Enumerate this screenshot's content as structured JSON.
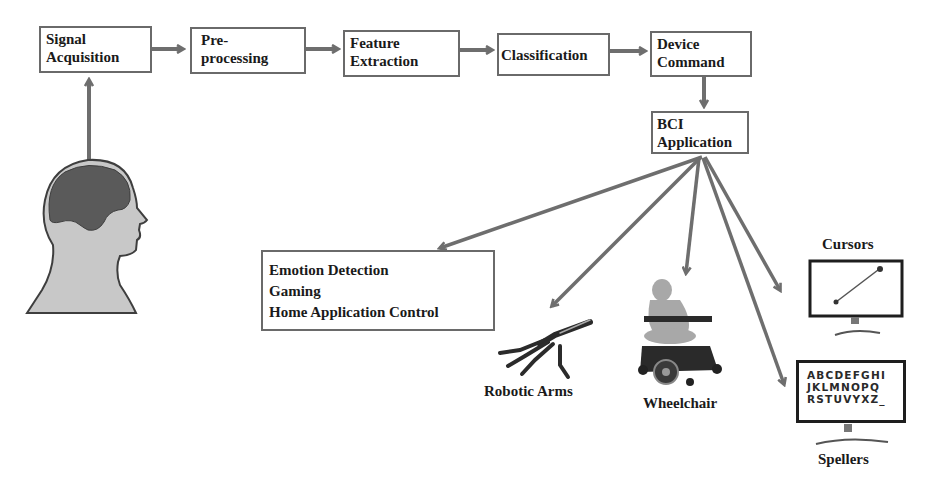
{
  "pipeline": {
    "stages": [
      {
        "line1": "Signal",
        "line2": "Acquisition"
      },
      {
        "line1": "Pre-",
        "line2": "processing"
      },
      {
        "line1": "Feature",
        "line2": "Extraction"
      },
      {
        "line1": "Classification",
        "line2": ""
      },
      {
        "line1": "Device",
        "line2": "Command"
      }
    ],
    "application": {
      "line1": "BCI",
      "line2": "Application"
    }
  },
  "applications": {
    "list_box": [
      "Emotion Detection",
      "Gaming",
      "Home Application Control"
    ],
    "robotic_arms": "Robotic Arms",
    "wheelchair": "Wheelchair",
    "cursors": "Cursors",
    "spellers": "Spellers",
    "speller_rows": [
      "ABCDEFGHI",
      "JKLMNOPQ",
      "RSTUVYXZ_"
    ]
  },
  "colors": {
    "arrow": "#6e6e6e",
    "box_border": "#6a6a6a",
    "brain": "#5a5a5a",
    "head": "#c8c8c8"
  }
}
